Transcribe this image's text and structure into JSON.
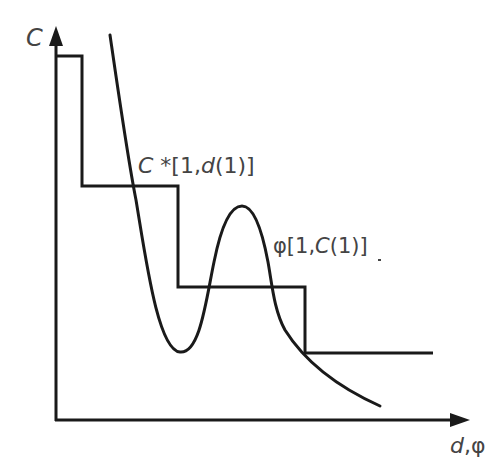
{
  "figure": {
    "type": "diagram",
    "axes": {
      "y_label": "C",
      "x_label": "d,φ"
    },
    "series": [
      {
        "name": "C*[1,d(1)]",
        "label_parts": {
          "c": "C",
          "rest": " *[1,",
          "d": "d",
          "tail": "(1)]"
        },
        "kind": "step"
      },
      {
        "name": "φ[1,C(1)]",
        "label_parts": {
          "phi": "φ[1,",
          "c": "C",
          "tail": "(1)]"
        },
        "kind": "curve"
      }
    ],
    "colors": {
      "line": "#1a1a1a",
      "text": "#444444",
      "background": "#ffffff"
    }
  }
}
